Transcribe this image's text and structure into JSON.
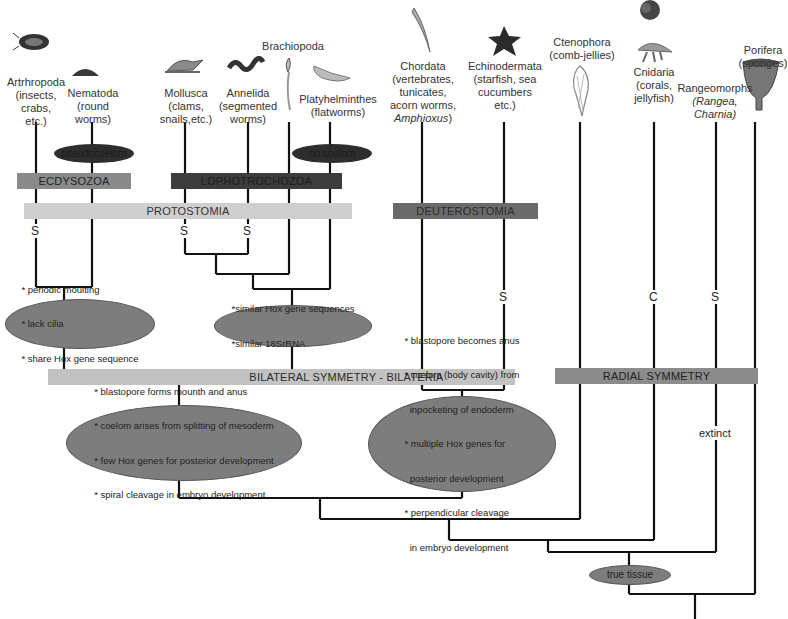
{
  "taxa": [
    {
      "id": "arthropoda",
      "name": "Artrhropoda",
      "detail": [
        "(insects,",
        "crabs,",
        "etc.)"
      ]
    },
    {
      "id": "nematoda",
      "name": "Nematoda",
      "detail": [
        "(round",
        "worms)"
      ]
    },
    {
      "id": "mollusca",
      "name": "Mollusca",
      "detail": [
        "(clams,",
        "snails,etc.)"
      ]
    },
    {
      "id": "annelida",
      "name": "Annelida",
      "detail": [
        "(segmented",
        "worms)"
      ]
    },
    {
      "id": "brachiopoda",
      "name": "Brachiopoda",
      "detail": []
    },
    {
      "id": "platyhelminthes",
      "name": "Platyhelminthes",
      "detail": [
        "(flatworms)"
      ]
    },
    {
      "id": "chordata",
      "name": "Chordata",
      "detail": [
        "(vertebrates,",
        "tunicates,",
        "acorn worms,"
      ],
      "italic_line": "Amphioxus",
      "italic_suffix": ")"
    },
    {
      "id": "echinodermata",
      "name": "Echinodermata",
      "detail": [
        "(starfish, sea",
        "cucumbers",
        "etc.)"
      ]
    },
    {
      "id": "ctenophora",
      "name": "Ctenophora",
      "detail": [
        "(comb-jellies)"
      ]
    },
    {
      "id": "cnidaria",
      "name": "Cnidaria",
      "detail": [
        "(corals,",
        "jellyfish)"
      ]
    },
    {
      "id": "rangeomorphs",
      "name": "Rangeomorphs",
      "italic_lines": [
        "(Rangea,",
        "Charnia)"
      ]
    },
    {
      "id": "porifera",
      "name": "Porifera",
      "detail": [
        "(sponges)"
      ]
    }
  ],
  "bars": {
    "ecdysozoa": "ECDYSOZOA",
    "lophotrochozoa": "LOPHOTROCHOZOA",
    "protostomia": "PROTOSTOMIA",
    "deuterostomia": "DEUTEROSTOMIA",
    "bilateria": "BILATERAL SYMMETRY - BILATERIA",
    "radial": "RADIAL SYMMETRY"
  },
  "small_ovals": {
    "pseudocoelom": "pseudocoelom",
    "no_coelom": "no coelom",
    "true_tissue": "true tissue"
  },
  "trait_ovals": {
    "ecdysozoa_traits": [
      "* periodic moulting",
      "* lack cilia",
      "* share Hox gene sequence"
    ],
    "lophotrochozoa_traits": [
      "*similar Hox gene sequences",
      "*similar 18SrRNA"
    ],
    "protostome_traits": [
      "* blastopore forms mounth and anus",
      "* coelom arises from splitting of mesoderm",
      "* few Hox genes for posterior development",
      "* spiral cleavage in embryo development"
    ],
    "deuterostome_traits": [
      "* blastopore becomes anus",
      "* coelom (body cavity) from",
      "  inpocketing of endoderm",
      "* multiple Hox genes for",
      "  posterior development",
      "* perpendicular cleavage",
      "  in embryo development"
    ]
  },
  "marks": {
    "s_arthropoda": "S",
    "s_mollusca": "S",
    "s_annelida": "S",
    "s_echinodermata": "S",
    "c_cnidaria": "C",
    "s_rangeomorphs": "S",
    "extinct": "extinct"
  },
  "colors": {
    "ecdysozoa": "#8a8a8a",
    "lophotrochozoa": "#3c3c3c",
    "protostomia": "#cfcfcf",
    "deuterostomia": "#6a6a6a",
    "bilateria": "#c2c2c2",
    "radial": "#8c8c8c",
    "oval": "#7d7d7d",
    "dark_oval": "#2e2e2e",
    "line": "#111111"
  }
}
